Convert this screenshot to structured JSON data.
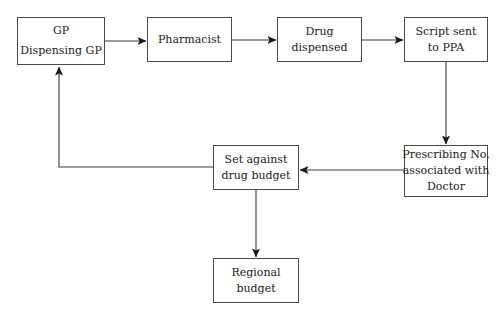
{
  "diagram": {
    "type": "flowchart",
    "background_color": "#ffffff",
    "node_border_color": "#4a4a4a",
    "edge_color": "#3a3a3a",
    "text_color": "#1a1a1a",
    "nodes": [
      {
        "id": "gp",
        "lines": [
          "GP",
          "Dispensing GP"
        ]
      },
      {
        "id": "pharmacist",
        "lines": [
          "Pharmacist"
        ]
      },
      {
        "id": "dispensed",
        "lines": [
          "Drug",
          "dispensed"
        ]
      },
      {
        "id": "script",
        "lines": [
          "Script sent",
          "to PPA"
        ]
      },
      {
        "id": "prescribing",
        "lines": [
          "Prescribing No.",
          "associated with",
          "Doctor"
        ]
      },
      {
        "id": "setagainst",
        "lines": [
          "Set against",
          "drug budget"
        ]
      },
      {
        "id": "regional",
        "lines": [
          "Regional",
          "budget"
        ]
      }
    ],
    "edges": [
      {
        "id": "gp-to-pharmacist",
        "from": "gp",
        "to": "pharmacist",
        "label": "",
        "direction": "right"
      },
      {
        "id": "pharmacist-to-dispensed",
        "from": "pharmacist",
        "to": "dispensed",
        "label": "",
        "direction": "right"
      },
      {
        "id": "dispensed-to-script",
        "from": "dispensed",
        "to": "script",
        "label": "",
        "direction": "right"
      },
      {
        "id": "script-to-prescribing",
        "from": "script",
        "to": "prescribing",
        "label": "",
        "direction": "down"
      },
      {
        "id": "prescribing-to-setagainst",
        "from": "prescribing",
        "to": "setagainst",
        "label": "",
        "direction": "left"
      },
      {
        "id": "setagainst-to-regional",
        "from": "setagainst",
        "to": "regional",
        "label": "",
        "direction": "down"
      },
      {
        "id": "setagainst-to-gp",
        "from": "setagainst",
        "to": "gp",
        "label": "",
        "direction": "up-left-feedback"
      }
    ]
  }
}
